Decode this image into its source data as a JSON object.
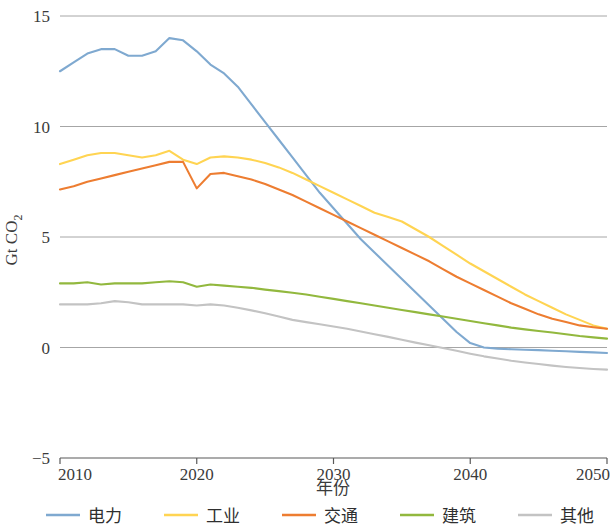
{
  "chart_data": {
    "type": "line",
    "title": "",
    "xlabel": "年份",
    "ylabel": "Gt CO2",
    "ylabel_display": "Gt CO₂",
    "xlim": [
      2010,
      2050
    ],
    "ylim": [
      -5,
      15
    ],
    "ytick_labels": [
      "15",
      "10",
      "5",
      "0",
      "−5"
    ],
    "ytick_values": [
      15,
      10,
      5,
      0,
      -5
    ],
    "xtick_labels": [
      "2010",
      "2020",
      "2030",
      "2040",
      "2050"
    ],
    "xtick_values": [
      2010,
      2020,
      2030,
      2040,
      2050
    ],
    "grid": "horizontal",
    "legend_position": "bottom",
    "x": [
      2010,
      2011,
      2012,
      2013,
      2014,
      2015,
      2016,
      2017,
      2018,
      2019,
      2020,
      2021,
      2022,
      2023,
      2024,
      2025,
      2026,
      2027,
      2028,
      2029,
      2030,
      2031,
      2032,
      2033,
      2034,
      2035,
      2036,
      2037,
      2038,
      2039,
      2040,
      2041,
      2042,
      2043,
      2044,
      2045,
      2046,
      2047,
      2048,
      2049,
      2050
    ],
    "series": [
      {
        "name": "电力",
        "color": "#7FA9D0",
        "values": [
          12.5,
          12.9,
          13.3,
          13.5,
          13.5,
          13.2,
          13.2,
          13.4,
          14.0,
          13.9,
          13.4,
          12.8,
          12.4,
          11.8,
          11.0,
          10.2,
          9.4,
          8.6,
          7.8,
          7.0,
          6.3,
          5.6,
          4.9,
          4.3,
          3.7,
          3.1,
          2.5,
          1.9,
          1.3,
          0.7,
          0.2,
          0.0,
          -0.05,
          -0.08,
          -0.1,
          -0.12,
          -0.15,
          -0.17,
          -0.2,
          -0.22,
          -0.25
        ]
      },
      {
        "name": "工业",
        "color": "#FFD452",
        "values": [
          8.3,
          8.5,
          8.7,
          8.8,
          8.8,
          8.7,
          8.6,
          8.7,
          8.9,
          8.5,
          8.3,
          8.6,
          8.65,
          8.6,
          8.5,
          8.35,
          8.15,
          7.9,
          7.6,
          7.3,
          7.0,
          6.7,
          6.4,
          6.1,
          5.9,
          5.7,
          5.35,
          5.0,
          4.6,
          4.2,
          3.8,
          3.45,
          3.1,
          2.75,
          2.4,
          2.1,
          1.8,
          1.5,
          1.25,
          1.0,
          0.85
        ]
      },
      {
        "name": "交通",
        "color": "#ED7D31",
        "values": [
          7.15,
          7.3,
          7.5,
          7.65,
          7.8,
          7.95,
          8.1,
          8.25,
          8.4,
          8.4,
          7.2,
          7.85,
          7.9,
          7.75,
          7.6,
          7.4,
          7.15,
          6.9,
          6.6,
          6.3,
          6.0,
          5.7,
          5.4,
          5.1,
          4.8,
          4.5,
          4.2,
          3.9,
          3.55,
          3.2,
          2.9,
          2.6,
          2.3,
          2.0,
          1.75,
          1.5,
          1.3,
          1.15,
          1.0,
          0.92,
          0.85
        ]
      },
      {
        "name": "建筑",
        "color": "#92B83E",
        "values": [
          2.9,
          2.9,
          2.95,
          2.85,
          2.9,
          2.9,
          2.9,
          2.95,
          3.0,
          2.95,
          2.75,
          2.85,
          2.8,
          2.75,
          2.7,
          2.62,
          2.55,
          2.48,
          2.4,
          2.3,
          2.2,
          2.1,
          2.0,
          1.9,
          1.8,
          1.7,
          1.6,
          1.5,
          1.4,
          1.3,
          1.2,
          1.1,
          1.0,
          0.9,
          0.82,
          0.75,
          0.68,
          0.6,
          0.52,
          0.46,
          0.4
        ]
      },
      {
        "name": "其他",
        "color": "#C3C3C3",
        "values": [
          1.95,
          1.95,
          1.95,
          2.0,
          2.1,
          2.05,
          1.95,
          1.95,
          1.95,
          1.95,
          1.9,
          1.95,
          1.9,
          1.8,
          1.68,
          1.55,
          1.4,
          1.25,
          1.15,
          1.05,
          0.95,
          0.85,
          0.72,
          0.6,
          0.48,
          0.35,
          0.22,
          0.1,
          -0.02,
          -0.15,
          -0.28,
          -0.4,
          -0.5,
          -0.6,
          -0.68,
          -0.75,
          -0.82,
          -0.88,
          -0.93,
          -0.97,
          -1.0
        ]
      }
    ]
  },
  "legend": {
    "items": [
      {
        "label": "电力",
        "color": "#7FA9D0"
      },
      {
        "label": "工业",
        "color": "#FFD452"
      },
      {
        "label": "交通",
        "color": "#ED7D31"
      },
      {
        "label": "建筑",
        "color": "#92B83E"
      },
      {
        "label": "其他",
        "color": "#C3C3C3"
      }
    ]
  }
}
